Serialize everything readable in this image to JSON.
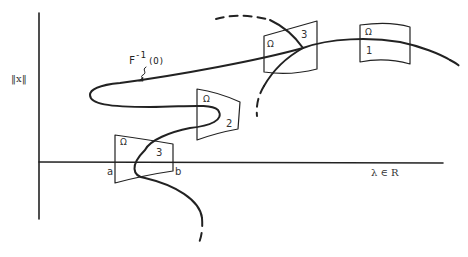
{
  "diagram": {
    "y_axis_label": "‖x‖",
    "x_axis_label": "λ ∈ R",
    "curve_label": "F",
    "curve_label_sup": "-1",
    "curve_label_arg": "(O)",
    "regions": [
      {
        "name": "region-1",
        "omega": "Ω",
        "index": "1"
      },
      {
        "name": "region-2",
        "omega": "Ω",
        "index": "2"
      },
      {
        "name": "region-3-top",
        "omega": "Ω",
        "index": "3"
      },
      {
        "name": "region-3-bottom",
        "omega": "Ω",
        "index": "3"
      }
    ],
    "interval_left": "a",
    "interval_right": "b"
  }
}
